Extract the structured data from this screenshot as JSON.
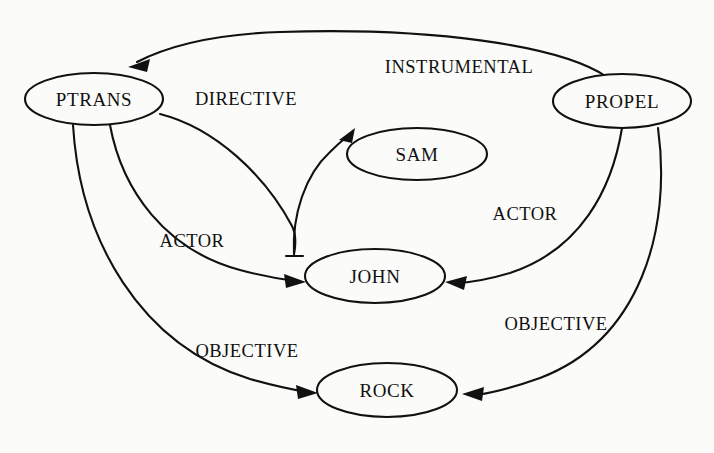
{
  "diagram": {
    "type": "conceptual-dependency-graph",
    "background_color": "#fbfbf9",
    "stroke_color": "#111111",
    "nodes": [
      {
        "id": "ptrans",
        "label": "PTRANS",
        "cx": 94,
        "cy": 99,
        "rx": 69,
        "ry": 26
      },
      {
        "id": "propel",
        "label": "PROPEL",
        "cx": 622,
        "cy": 101,
        "rx": 69,
        "ry": 27
      },
      {
        "id": "sam",
        "label": "SAM",
        "cx": 417,
        "cy": 154,
        "rx": 70,
        "ry": 26
      },
      {
        "id": "john",
        "label": "JOHN",
        "cx": 375,
        "cy": 276,
        "rx": 70,
        "ry": 27
      },
      {
        "id": "rock",
        "label": "ROCK",
        "cx": 387,
        "cy": 390,
        "rx": 70,
        "ry": 27
      }
    ],
    "edges": [
      {
        "id": "instrumental",
        "label": "INSTRUMENTAL",
        "from": "propel",
        "to": "ptrans",
        "label_x": 459,
        "label_y": 67
      },
      {
        "id": "directive",
        "label": "DIRECTIVE",
        "from": "ptrans",
        "to": "sam",
        "label_x": 246,
        "label_y": 99
      },
      {
        "id": "actor-left",
        "label": "ACTOR",
        "from": "ptrans",
        "to": "john",
        "label_x": 192,
        "label_y": 241
      },
      {
        "id": "objective-left",
        "label": "OBJECTIVE",
        "from": "ptrans",
        "to": "rock",
        "label_x": 247,
        "label_y": 351
      },
      {
        "id": "actor-right",
        "label": "ACTOR",
        "from": "propel",
        "to": "john",
        "label_x": 525,
        "label_y": 214
      },
      {
        "id": "objective-right",
        "label": "OBJECTIVE",
        "from": "propel",
        "to": "rock",
        "label_x": 556,
        "label_y": 324
      }
    ]
  }
}
